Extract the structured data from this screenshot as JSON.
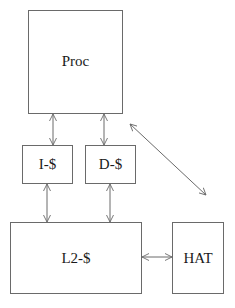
{
  "diagram": {
    "nodes": [
      {
        "id": "proc",
        "label": "Proc"
      },
      {
        "id": "icache",
        "label": "I-$"
      },
      {
        "id": "dcache",
        "label": "D-$"
      },
      {
        "id": "l2cache",
        "label": "L2-$"
      },
      {
        "id": "hat",
        "label": "HAT"
      }
    ],
    "edges": [
      {
        "from": "proc",
        "to": "icache",
        "type": "bidirectional"
      },
      {
        "from": "proc",
        "to": "dcache",
        "type": "bidirectional"
      },
      {
        "from": "icache",
        "to": "l2cache",
        "type": "bidirectional"
      },
      {
        "from": "dcache",
        "to": "l2cache",
        "type": "bidirectional"
      },
      {
        "from": "l2cache",
        "to": "hat",
        "type": "bidirectional"
      },
      {
        "from": "proc",
        "to": "hat",
        "type": "bidirectional",
        "note": "floating diagonal arrow"
      }
    ],
    "colors": {
      "line": "#6a6a6a",
      "text": "#1a1a1a",
      "background": "#ffffff"
    }
  }
}
